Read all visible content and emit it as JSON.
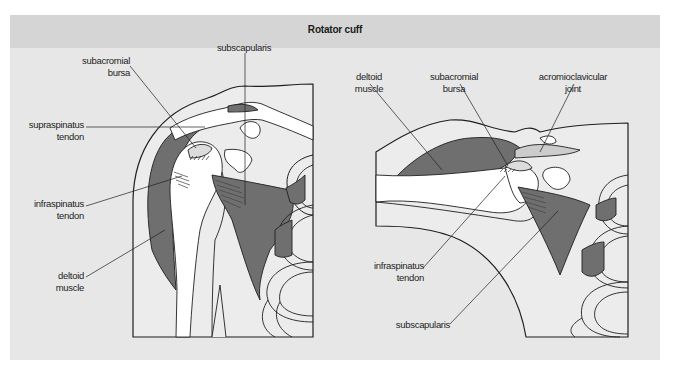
{
  "title": "Rotator cuff",
  "colors": {
    "panel_background": "#e7e7e7",
    "header_background": "#d5d5d5",
    "muscle_fill": "#6f6f6f",
    "bone_fill": "#ffffff",
    "outline": "#1f1f1f"
  },
  "figures": [
    {
      "view": "anterior",
      "labels": [
        {
          "id": "subacromial-bursa",
          "lines": [
            "subacromial",
            "bursa"
          ]
        },
        {
          "id": "subscapularis",
          "lines": [
            "subscapularis"
          ]
        },
        {
          "id": "supraspinatus-tendon",
          "lines": [
            "supraspinatus",
            "tendon"
          ]
        },
        {
          "id": "infraspinatus-tendon",
          "lines": [
            "infraspinatus",
            "tendon"
          ]
        },
        {
          "id": "deltoid-muscle",
          "lines": [
            "deltoid",
            "muscle"
          ]
        }
      ]
    },
    {
      "view": "abducted",
      "labels": [
        {
          "id": "deltoid-muscle",
          "lines": [
            "deltoid",
            "muscle"
          ]
        },
        {
          "id": "subacromial-bursa",
          "lines": [
            "subacromial",
            "bursa"
          ]
        },
        {
          "id": "acromioclavicular-joint",
          "lines": [
            "acromioclavicular",
            "joint"
          ]
        },
        {
          "id": "infraspinatus-tendon",
          "lines": [
            "infraspinatus",
            "tendon"
          ]
        },
        {
          "id": "subscapularis",
          "lines": [
            "subscapularis"
          ]
        }
      ]
    }
  ]
}
